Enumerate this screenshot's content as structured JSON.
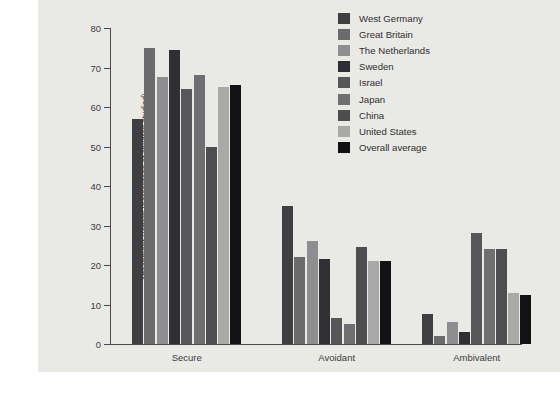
{
  "chart_data": {
    "type": "bar",
    "title": "",
    "xlabel": "",
    "ylabel": "Attachment Pattern (percentage of children studied)",
    "ylim": [
      0,
      80
    ],
    "yticks": [
      0,
      10,
      20,
      30,
      40,
      50,
      60,
      70,
      80
    ],
    "grid": false,
    "legend_position": "top-right",
    "categories": [
      "Secure",
      "Avoidant",
      "Ambivalent"
    ],
    "series": [
      {
        "name": "West Germany",
        "color": "#3f3f42",
        "values": [
          57,
          35,
          7.5
        ]
      },
      {
        "name": "Great Britain",
        "color": "#6b6b6e",
        "values": [
          75,
          22,
          2
        ]
      },
      {
        "name": "The Netherlands",
        "color": "#8e8e90",
        "values": [
          67.5,
          26,
          5.5
        ]
      },
      {
        "name": "Sweden",
        "color": "#303034",
        "values": [
          74.5,
          21.5,
          3
        ]
      },
      {
        "name": "Israel",
        "color": "#575759",
        "values": [
          64.5,
          6.5,
          28
        ]
      },
      {
        "name": "Japan",
        "color": "#6f6f72",
        "values": [
          68,
          5,
          24
        ]
      },
      {
        "name": "China",
        "color": "#4e4e51",
        "values": [
          50,
          24.5,
          24
        ]
      },
      {
        "name": "United States",
        "color": "#a9a9a8",
        "values": [
          65,
          21,
          13
        ]
      },
      {
        "name": "Overall average",
        "color": "#121214",
        "values": [
          65.5,
          21,
          12.5
        ]
      }
    ]
  },
  "legend": {
    "items": [
      {
        "label": "West Germany"
      },
      {
        "label": "Great Britain"
      },
      {
        "label": "The Netherlands"
      },
      {
        "label": "Sweden"
      },
      {
        "label": "Israel"
      },
      {
        "label": "Japan"
      },
      {
        "label": "China"
      },
      {
        "label": "United States"
      },
      {
        "label": "Overall average"
      }
    ]
  }
}
